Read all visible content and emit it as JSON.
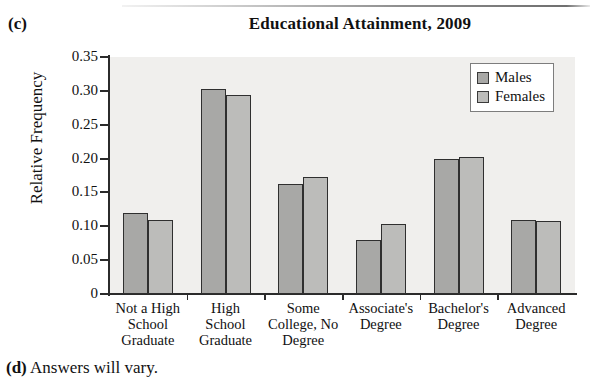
{
  "part_labels": {
    "c": "(c)",
    "d_marker": "(d)",
    "d_text": " Answers will vary."
  },
  "chart_data": {
    "type": "bar",
    "title": "Educational Attainment, 2009",
    "xlabel": "",
    "ylabel": "Relative Frequency",
    "ylim": [
      0,
      0.35
    ],
    "grid": false,
    "legend_position": "top-right",
    "categories": [
      "Not a High School Graduate",
      "High School Graduate",
      "Some College, No Degree",
      "Associate's Degree",
      "Bachelor's Degree",
      "Advanced Degree"
    ],
    "category_lines": [
      [
        "Not a High",
        "School",
        "Graduate"
      ],
      [
        "High",
        "School",
        "Graduate"
      ],
      [
        "Some",
        "College, No",
        "Degree"
      ],
      [
        "Associate's",
        "Degree"
      ],
      [
        "Bachelor's",
        "Degree"
      ],
      [
        "Advanced",
        "Degree"
      ]
    ],
    "series": [
      {
        "name": "Males",
        "color": "#a8a8a6",
        "values": [
          0.12,
          0.303,
          0.163,
          0.08,
          0.2,
          0.11
        ]
      },
      {
        "name": "Females",
        "color": "#bcbcba",
        "values": [
          0.11,
          0.294,
          0.173,
          0.103,
          0.202,
          0.108
        ]
      }
    ],
    "y_ticks": [
      0,
      0.05,
      0.1,
      0.15,
      0.2,
      0.25,
      0.3,
      0.35
    ],
    "y_tick_labels": [
      "0",
      "0.05",
      "0.10",
      "0.15",
      "0.20",
      "0.25",
      "0.30",
      "0.35"
    ]
  }
}
